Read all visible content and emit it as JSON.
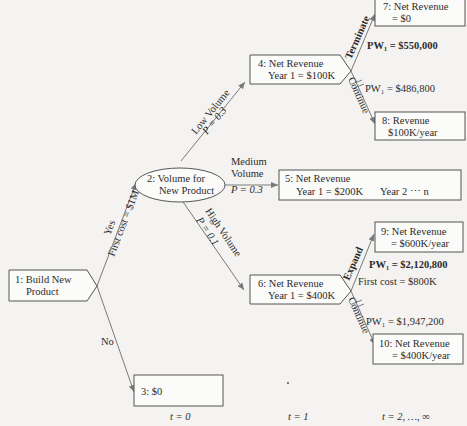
{
  "diagram": {
    "type": "decision-tree",
    "nodes": {
      "n1": {
        "line1": "1: Build New",
        "line2": "Product",
        "shape": "decision"
      },
      "n2": {
        "line1": "2: Volume for",
        "line2": "New Product",
        "shape": "chance"
      },
      "n3": {
        "line1": "3: $0",
        "shape": "outcome"
      },
      "n4": {
        "line1": "4: Net Revenue",
        "line2": "Year 1 = $100K",
        "shape": "decision"
      },
      "n5": {
        "line1": "5: Net Revenue",
        "line2": "Year 1 = $200K",
        "line2b": "Year 2 ⋯ n",
        "shape": "outcome"
      },
      "n6": {
        "line1": "6: Net Revenue",
        "line2": "Year 1 = $400K",
        "shape": "decision"
      },
      "n7": {
        "line1": "7: Net Revenue",
        "line2": "= $0",
        "shape": "outcome"
      },
      "n8": {
        "line1": "8: Revenue",
        "line2": "$100K/year",
        "shape": "outcome"
      },
      "n9": {
        "line1": "9: Net Revenue",
        "line2": "= $600K/year",
        "shape": "outcome"
      },
      "n10": {
        "line1": "10: Net Revenue",
        "line2": "= $400K/year",
        "shape": "outcome"
      }
    },
    "edges": {
      "yes": {
        "label": "Yes",
        "sublabel": "First cost = $1M"
      },
      "no": {
        "label": "No"
      },
      "low": {
        "label": "Low Volume",
        "prob": "P = 0.3"
      },
      "medium": {
        "label1": "Medium",
        "label2": "Volume",
        "prob": "P = 0.3"
      },
      "high": {
        "label": "High Volume",
        "prob": "P = 0.1"
      },
      "terminate": {
        "label": "Terminate"
      },
      "continue4": {
        "label": "Continue"
      },
      "expand": {
        "label": "Expand"
      },
      "continue6": {
        "label": "Continue"
      }
    },
    "annotations": {
      "pw_terminate": "PW₁ = $550,000",
      "pw_continue4": "PW₁ = $486,800",
      "pw_expand": "PW₁ = $2,120,800",
      "expand_cost": "First cost = $800K",
      "pw_continue6": "PW₁ = $1,947,200"
    },
    "timeline": {
      "t0": "t = 0",
      "t1": "t = 1",
      "t2": "t = 2, …, ∞"
    }
  }
}
